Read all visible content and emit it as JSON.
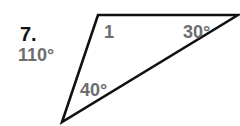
{
  "problem": {
    "number": "7.",
    "answer_hint": "110°"
  },
  "triangle": {
    "vertices": [
      [
        98,
        15
      ],
      [
        238,
        15
      ],
      [
        62,
        122
      ]
    ],
    "angle_labels": {
      "unknown": "1",
      "top_right": "30°",
      "bottom": "40°"
    },
    "stroke_color": "#111111",
    "label_color": "#6e6e6e"
  }
}
